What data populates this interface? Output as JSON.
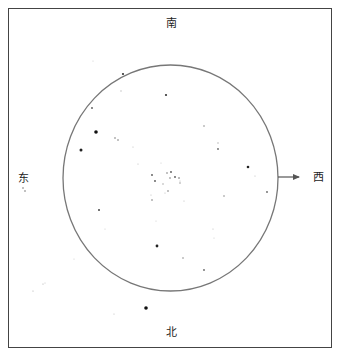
{
  "star_map": {
    "directions": {
      "top": "南",
      "bottom": "北",
      "left": "东",
      "right": "西"
    },
    "field_of_view": {
      "cx": 170.5,
      "cy": 178,
      "rx": 107.5,
      "ry": 113,
      "stroke": "#777777"
    },
    "arrow": {
      "x1": 278,
      "y1": 177,
      "x2": 299,
      "y2": 177,
      "direction": "west",
      "color": "#555555"
    },
    "stars": [
      {
        "x": 93,
        "y": 61,
        "r": 0.6,
        "c": "#cccccc"
      },
      {
        "x": 123,
        "y": 74,
        "r": 1.1,
        "c": "#333333"
      },
      {
        "x": 121,
        "y": 91,
        "r": 0.7,
        "c": "#bbbbbb"
      },
      {
        "x": 166,
        "y": 95,
        "r": 1.1,
        "c": "#333333"
      },
      {
        "x": 92,
        "y": 108,
        "r": 0.9,
        "c": "#555555"
      },
      {
        "x": 96,
        "y": 132,
        "r": 1.8,
        "c": "#111111"
      },
      {
        "x": 81,
        "y": 150,
        "r": 1.5,
        "c": "#222222"
      },
      {
        "x": 115,
        "y": 138,
        "r": 0.8,
        "c": "#777777"
      },
      {
        "x": 118,
        "y": 140,
        "r": 0.8,
        "c": "#777777"
      },
      {
        "x": 133,
        "y": 147,
        "r": 0.6,
        "c": "#bbbbbb"
      },
      {
        "x": 204,
        "y": 126,
        "r": 0.8,
        "c": "#888888"
      },
      {
        "x": 218,
        "y": 143,
        "r": 0.7,
        "c": "#aaaaaa"
      },
      {
        "x": 218,
        "y": 149,
        "r": 0.9,
        "c": "#666666"
      },
      {
        "x": 248,
        "y": 167,
        "r": 1.3,
        "c": "#222222"
      },
      {
        "x": 255,
        "y": 176,
        "r": 0.6,
        "c": "#bbbbbb"
      },
      {
        "x": 267,
        "y": 192,
        "r": 0.9,
        "c": "#666666"
      },
      {
        "x": 224,
        "y": 196,
        "r": 0.8,
        "c": "#888888"
      },
      {
        "x": 138,
        "y": 164,
        "r": 0.6,
        "c": "#bbbbbb"
      },
      {
        "x": 161,
        "y": 163,
        "r": 0.6,
        "c": "#cccccc"
      },
      {
        "x": 152,
        "y": 175,
        "r": 0.9,
        "c": "#555555"
      },
      {
        "x": 155,
        "y": 181,
        "r": 0.9,
        "c": "#555555"
      },
      {
        "x": 167,
        "y": 173,
        "r": 0.8,
        "c": "#777777"
      },
      {
        "x": 171,
        "y": 172,
        "r": 0.9,
        "c": "#555555"
      },
      {
        "x": 170,
        "y": 178,
        "r": 0.8,
        "c": "#777777"
      },
      {
        "x": 175,
        "y": 177,
        "r": 0.9,
        "c": "#555555"
      },
      {
        "x": 179,
        "y": 178,
        "r": 0.8,
        "c": "#666666"
      },
      {
        "x": 180,
        "y": 183,
        "r": 0.7,
        "c": "#888888"
      },
      {
        "x": 163,
        "y": 184,
        "r": 0.7,
        "c": "#999999"
      },
      {
        "x": 168,
        "y": 191,
        "r": 0.8,
        "c": "#777777"
      },
      {
        "x": 165,
        "y": 193,
        "r": 0.6,
        "c": "#bbbbbb"
      },
      {
        "x": 151,
        "y": 195,
        "r": 0.6,
        "c": "#bbbbbb"
      },
      {
        "x": 152,
        "y": 200,
        "r": 0.8,
        "c": "#777777"
      },
      {
        "x": 180,
        "y": 181,
        "r": 0.6,
        "c": "#bbbbbb"
      },
      {
        "x": 184,
        "y": 201,
        "r": 0.6,
        "c": "#bbbbbb"
      },
      {
        "x": 99,
        "y": 210,
        "r": 1.0,
        "c": "#444444"
      },
      {
        "x": 105,
        "y": 229,
        "r": 0.6,
        "c": "#cccccc"
      },
      {
        "x": 156,
        "y": 221,
        "r": 0.6,
        "c": "#cccccc"
      },
      {
        "x": 157,
        "y": 246,
        "r": 1.4,
        "c": "#222222"
      },
      {
        "x": 213,
        "y": 229,
        "r": 0.6,
        "c": "#bbbbbb"
      },
      {
        "x": 214,
        "y": 238,
        "r": 0.6,
        "c": "#cccccc"
      },
      {
        "x": 183,
        "y": 258,
        "r": 0.8,
        "c": "#888888"
      },
      {
        "x": 204,
        "y": 270,
        "r": 0.9,
        "c": "#666666"
      },
      {
        "x": 74,
        "y": 259,
        "r": 0.6,
        "c": "#cccccc"
      },
      {
        "x": 33,
        "y": 291,
        "r": 0.6,
        "c": "#aaaaaa"
      },
      {
        "x": 43,
        "y": 284,
        "r": 0.6,
        "c": "#aaaaaa"
      },
      {
        "x": 45,
        "y": 283,
        "r": 0.5,
        "c": "#bbbbbb"
      },
      {
        "x": 146,
        "y": 308,
        "r": 1.8,
        "c": "#111111"
      },
      {
        "x": 114,
        "y": 314,
        "r": 0.6,
        "c": "#bbbbbb"
      },
      {
        "x": 23,
        "y": 188,
        "r": 0.7,
        "c": "#555555"
      },
      {
        "x": 25,
        "y": 191,
        "r": 0.7,
        "c": "#555555"
      }
    ]
  }
}
